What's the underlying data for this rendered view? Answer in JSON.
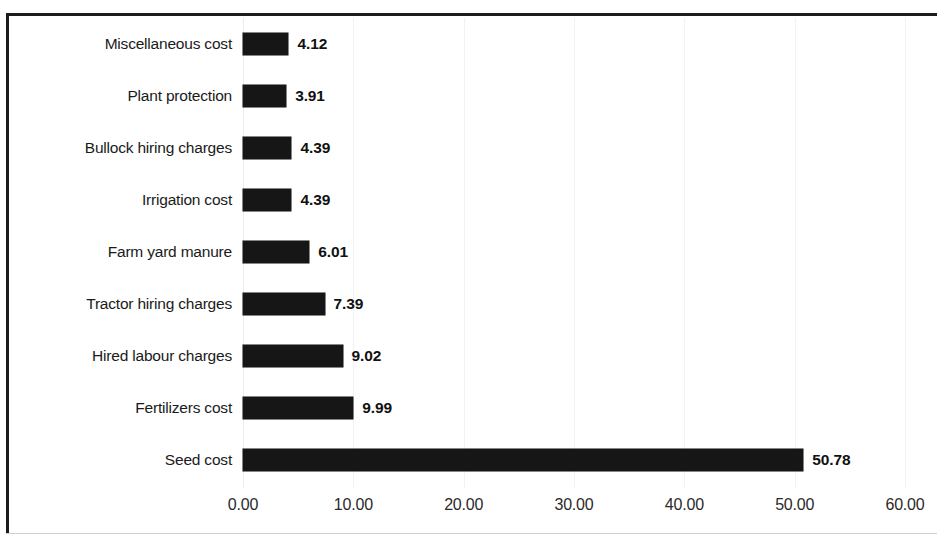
{
  "chart_data": {
    "type": "bar",
    "orientation": "horizontal",
    "title": "",
    "subtitle": "",
    "xlabel": "",
    "ylabel": "",
    "categories": [
      "Miscellaneous cost",
      "Plant protection",
      "Bullock hiring charges",
      "Irrigation cost",
      "Farm yard manure",
      "Tractor hiring charges",
      "Hired labour charges",
      "Fertilizers cost",
      "Seed cost"
    ],
    "values": [
      4.12,
      3.91,
      4.39,
      4.39,
      6.01,
      7.39,
      9.02,
      9.99,
      50.78
    ],
    "value_labels": [
      "4.12",
      "3.91",
      "4.39",
      "4.39",
      "6.01",
      "7.39",
      "9.02",
      "9.99",
      "50.78"
    ],
    "xlim": [
      0,
      60
    ],
    "xticks": [
      0,
      10,
      20,
      30,
      40,
      50,
      60
    ],
    "xtick_labels": [
      "0.00",
      "10.00",
      "20.00",
      "30.00",
      "40.00",
      "50.00",
      "60.00"
    ],
    "grid": true,
    "legend": false,
    "bar_color": "#161616",
    "grid_color": "#f2f2f2",
    "text_color": "#1a1a1a",
    "background": "#ffffff"
  }
}
